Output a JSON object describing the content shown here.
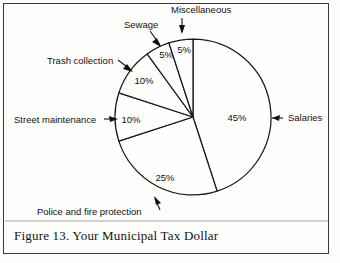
{
  "caption": "Figure 13. Your Municipal Tax Dollar",
  "chart_data": {
    "type": "pie",
    "title": "Figure 13. Your Municipal Tax Dollar",
    "unit": "%",
    "total": 100,
    "start_angle_deg": 0,
    "direction": "clockwise",
    "legend": "none",
    "categories": [
      "Salaries",
      "Police and fire protection",
      "Street maintenance",
      "Trash collection",
      "Sewage",
      "Miscellaneous"
    ],
    "values": [
      45,
      25,
      10,
      10,
      5,
      5
    ],
    "labels": [
      "45%",
      "25%",
      "10%",
      "10%",
      "5%",
      "5%"
    ],
    "slices": [
      {
        "name": "Salaries",
        "value": 45,
        "label": "45%",
        "pct_label_x": 237,
        "pct_label_y": 121,
        "cat_label_x": 288,
        "cat_label_y": 121,
        "cat_anchor": "start"
      },
      {
        "name": "Police and fire protection",
        "value": 25,
        "label": "25%",
        "pct_label_x": 165,
        "pct_label_y": 181,
        "cat_label_x": 37,
        "cat_label_y": 215,
        "cat_anchor": "start"
      },
      {
        "name": "Street maintenance",
        "value": 10,
        "label": "10%",
        "pct_label_x": 131,
        "pct_label_y": 123,
        "cat_label_x": 14,
        "cat_label_y": 123,
        "cat_anchor": "start"
      },
      {
        "name": "Trash collection",
        "value": 10,
        "label": "10%",
        "pct_label_x": 144,
        "pct_label_y": 84,
        "cat_label_x": 47,
        "cat_label_y": 64,
        "cat_anchor": "start"
      },
      {
        "name": "Sewage",
        "value": 5,
        "label": "5%",
        "pct_label_x": 166,
        "pct_label_y": 58,
        "cat_label_x": 124,
        "cat_label_y": 28,
        "cat_anchor": "start"
      },
      {
        "name": "Miscellaneous",
        "value": 5,
        "label": "5%",
        "pct_label_x": 184,
        "pct_label_y": 53,
        "cat_label_x": 171,
        "cat_label_y": 13,
        "cat_anchor": "start"
      }
    ],
    "geometry": {
      "center_x": 193,
      "center_y": 117,
      "radius": 78
    }
  },
  "colors": {
    "ink": "#1a1a1a",
    "paper": "#fefefc",
    "frame": "#3a3a3a",
    "rule": "#9a9a9a"
  }
}
